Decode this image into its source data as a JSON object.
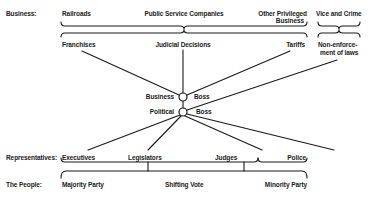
{
  "diagram": {
    "rows": {
      "business": "Business:",
      "representatives": "Representatives:",
      "people": "The People:"
    },
    "business_groups": {
      "railroads": "Railroads",
      "public_service": "Public Service Companies",
      "other_privileged_1": "Other Privileged",
      "other_privileged_2": "Business",
      "vice_crime": "Vice and Crime"
    },
    "benefits": {
      "franchises": "Franchises",
      "judicial": "Judicial Decisions",
      "tariffs": "Tariffs",
      "nonenforcement_1": "Non-enforce-",
      "nonenforcement_2": "ment of laws"
    },
    "nodes": {
      "business_left": "Business",
      "business_right": "Boss",
      "political_left": "Political",
      "political_right": "Boss"
    },
    "representatives": {
      "executives": "Executives",
      "legislators": "Legislators",
      "judges": "Judges",
      "police": "Police"
    },
    "people": {
      "majority": "Majority Party",
      "shifting": "Shifting Vote",
      "minority": "Minority Party"
    },
    "colors": {
      "ink": "#1a1a1a",
      "background": "#ffffff"
    }
  }
}
